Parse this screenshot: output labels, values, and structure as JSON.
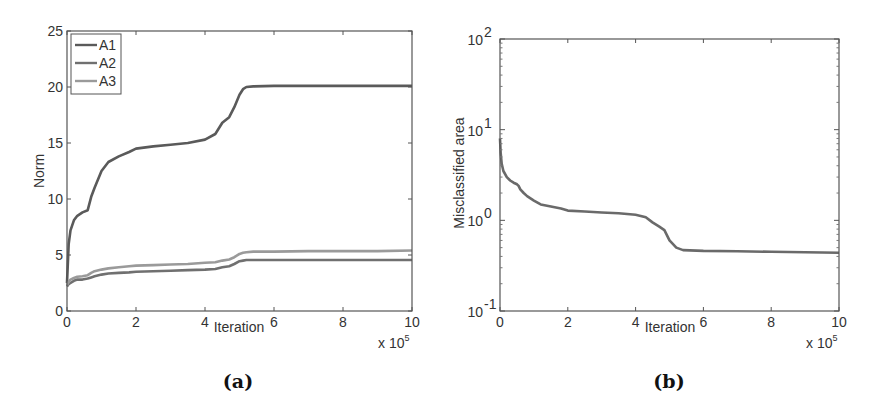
{
  "chart_data": [
    {
      "id": "a",
      "type": "line",
      "caption": "(a)",
      "title": "",
      "xlabel": "Iteration",
      "ylabel": "Norm",
      "x_multiplier_label": "x 10",
      "x_multiplier_exp": "5",
      "xlim": [
        0,
        10
      ],
      "ylim": [
        0,
        25
      ],
      "xticks": [
        "0",
        "2",
        "4",
        "6",
        "8",
        "10"
      ],
      "yticks": [
        "0",
        "5",
        "10",
        "15",
        "20",
        "25"
      ],
      "grid": false,
      "legend_position": "upper-left",
      "x": [
        0,
        0.05,
        0.1,
        0.2,
        0.3,
        0.45,
        0.6,
        0.7,
        0.8,
        1.0,
        1.2,
        1.5,
        1.8,
        2.0,
        2.5,
        3.0,
        3.5,
        4.0,
        4.3,
        4.5,
        4.7,
        4.85,
        5.0,
        5.1,
        5.2,
        5.4,
        6.0,
        7.0,
        8.0,
        9.0,
        10.0
      ],
      "series": [
        {
          "name": "A1",
          "color": "#5a5a5a",
          "values": [
            2.5,
            6.0,
            7.2,
            8.1,
            8.5,
            8.8,
            9.0,
            10.2,
            11.0,
            12.5,
            13.3,
            13.8,
            14.2,
            14.5,
            14.7,
            14.85,
            15.0,
            15.3,
            15.8,
            16.8,
            17.3,
            18.2,
            19.3,
            19.8,
            20.0,
            20.05,
            20.1,
            20.1,
            20.1,
            20.1,
            20.1
          ]
        },
        {
          "name": "A2",
          "color": "#707070",
          "values": [
            2.2,
            2.4,
            2.5,
            2.7,
            2.8,
            2.8,
            2.9,
            3.0,
            3.1,
            3.25,
            3.35,
            3.4,
            3.45,
            3.5,
            3.55,
            3.6,
            3.65,
            3.7,
            3.75,
            3.9,
            4.0,
            4.2,
            4.45,
            4.5,
            4.55,
            4.55,
            4.55,
            4.55,
            4.55,
            4.55,
            4.55
          ]
        },
        {
          "name": "A3",
          "color": "#9a9a9a",
          "values": [
            2.3,
            2.6,
            2.8,
            2.95,
            3.05,
            3.1,
            3.2,
            3.4,
            3.55,
            3.7,
            3.8,
            3.9,
            4.0,
            4.05,
            4.1,
            4.15,
            4.2,
            4.3,
            4.35,
            4.5,
            4.6,
            4.8,
            5.1,
            5.2,
            5.25,
            5.3,
            5.3,
            5.35,
            5.35,
            5.35,
            5.4
          ]
        }
      ]
    },
    {
      "id": "b",
      "type": "line",
      "caption": "(b)",
      "title": "",
      "xlabel": "Iteration",
      "ylabel": "Misclassified area",
      "x_multiplier_label": "x 10",
      "x_multiplier_exp": "5",
      "xlim": [
        0,
        10
      ],
      "ylim": [
        0.1,
        100
      ],
      "yscale": "log",
      "xticks": [
        "0",
        "2",
        "4",
        "6",
        "8",
        "10"
      ],
      "yticks": [
        {
          "base": "10",
          "exp": "-1",
          "value": 0.1
        },
        {
          "base": "10",
          "exp": "0",
          "value": 1
        },
        {
          "base": "10",
          "exp": "1",
          "value": 10
        },
        {
          "base": "10",
          "exp": "2",
          "value": 100
        }
      ],
      "grid": false,
      "x": [
        0,
        0.02,
        0.05,
        0.1,
        0.2,
        0.3,
        0.4,
        0.5,
        0.55,
        0.6,
        0.7,
        0.8,
        1.0,
        1.2,
        1.5,
        1.8,
        2.0,
        2.5,
        3.0,
        3.5,
        4.0,
        4.3,
        4.5,
        4.7,
        4.85,
        5.0,
        5.2,
        5.4,
        6.0,
        7.0,
        8.0,
        9.0,
        10.0
      ],
      "series": [
        {
          "name": "Misclassified area",
          "color": "#6a6a6a",
          "values": [
            8.0,
            5.5,
            4.2,
            3.5,
            3.0,
            2.75,
            2.6,
            2.5,
            2.4,
            2.2,
            2.0,
            1.85,
            1.65,
            1.5,
            1.42,
            1.35,
            1.28,
            1.25,
            1.22,
            1.2,
            1.15,
            1.08,
            0.95,
            0.85,
            0.78,
            0.6,
            0.5,
            0.47,
            0.46,
            0.455,
            0.45,
            0.445,
            0.44
          ]
        }
      ]
    }
  ]
}
